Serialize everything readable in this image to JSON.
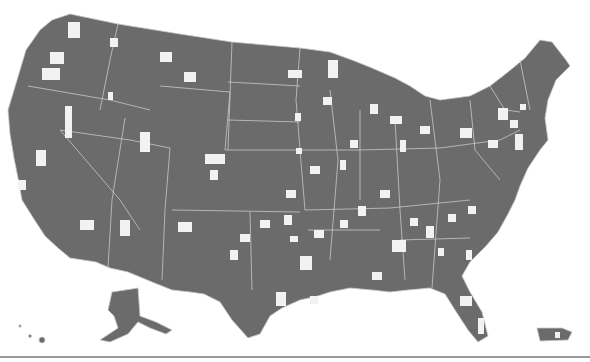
{
  "map": {
    "type": "choropleth",
    "subject": "United States counties",
    "colors": {
      "land": "#6b6b6b",
      "highlighted_county": "#f2f2f2",
      "state_border": "#c8c8c8",
      "background": "#ffffff"
    },
    "regions_shown": [
      "Contiguous United States",
      "Alaska",
      "Hawaii",
      "Puerto Rico"
    ],
    "legend": null,
    "title": null
  }
}
